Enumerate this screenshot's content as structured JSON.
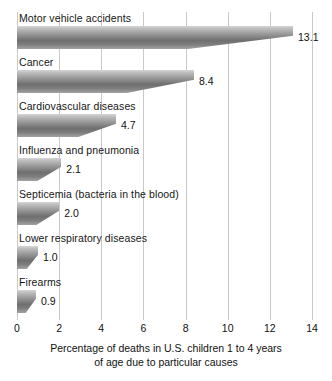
{
  "chart_data": {
    "type": "bar",
    "orientation": "horizontal",
    "title": "",
    "xlabel": "Percentage of deaths in U.S. children 1 to 4 years of age due to particular causes",
    "ylabel": "",
    "xlim": [
      0,
      14
    ],
    "xticks": [
      0,
      2,
      4,
      6,
      8,
      10,
      12,
      14
    ],
    "grid": "vertical",
    "legend": "none",
    "categories": [
      "Motor vehicle accidents",
      "Cancer",
      "Cardiovascular diseases",
      "Influenza and pneumonia",
      "Septicemia (bacteria in the blood)",
      "Lower respiratory diseases",
      "Firearms"
    ],
    "values": [
      13.1,
      8.4,
      4.7,
      2.1,
      2.0,
      1.0,
      0.9
    ],
    "value_labels": [
      "13.1",
      "8.4",
      "4.7",
      "2.1",
      "2.0",
      "1.0",
      "0.9"
    ]
  },
  "axis": {
    "tick_labels": [
      "0",
      "2",
      "4",
      "6",
      "8",
      "10",
      "12",
      "14"
    ],
    "caption_line1": "Percentage of deaths in U.S. children 1 to 4 years",
    "caption_line2": "of age due to particular causes"
  },
  "colors": {
    "background": "#ffffff",
    "gridline": "#c9c9c9",
    "bar_light": "#d5d5d5",
    "bar_dark": "#6f6f6f",
    "text": "#111111"
  }
}
